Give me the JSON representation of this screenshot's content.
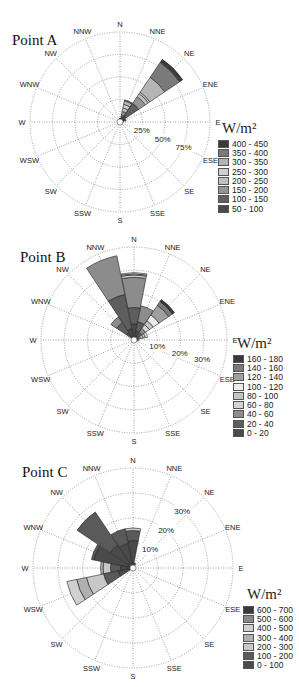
{
  "directions": [
    "N",
    "NNE",
    "NE",
    "ENE",
    "E",
    "ESE",
    "SE",
    "SSE",
    "S",
    "SSW",
    "SW",
    "WSW",
    "W",
    "WNW",
    "NW",
    "NNW"
  ],
  "chart_data": [
    {
      "type": "wind-rose",
      "title": "Point A",
      "unit": "W/m²",
      "rings": [
        25,
        50,
        75,
        100
      ],
      "ring_labels": [
        "25%",
        "50%",
        "75%"
      ],
      "legend": [
        "400 - 450",
        "350 - 400",
        "300 - 350",
        "250 - 300",
        "200 - 250",
        "150 - 200",
        "100 - 150",
        "50 - 100"
      ],
      "colors": [
        "#3a3a3a",
        "#7a7a7a",
        "#b5b5b5",
        "#cfcfcf",
        "#c0c0c0",
        "#959595",
        "#606060",
        "#4a4a4a"
      ],
      "bins_bottom_up": [
        "50 - 100",
        "100 - 150",
        "150 - 200",
        "200 - 250",
        "250 - 300",
        "300 - 350",
        "350 - 400",
        "400 - 450"
      ],
      "series": [
        {
          "dir": "N",
          "cum": [
            2,
            3,
            3.5,
            4,
            4,
            4,
            4,
            4
          ]
        },
        {
          "dir": "NNE",
          "cum": [
            5,
            8,
            12,
            16,
            20,
            24,
            25,
            25
          ]
        },
        {
          "dir": "NE",
          "cum": [
            8,
            25,
            34,
            38,
            40,
            60,
            80,
            84
          ]
        },
        {
          "dir": "ENE",
          "cum": [
            4,
            6,
            7,
            7,
            7,
            7,
            7,
            7
          ]
        },
        {
          "dir": "E",
          "cum": [
            1,
            1.5,
            1.5,
            1.5,
            1.5,
            1.5,
            1.5,
            1.5
          ]
        }
      ]
    },
    {
      "type": "wind-rose",
      "title": "Point B",
      "unit": "W/m²",
      "rings": [
        10,
        20,
        30,
        40
      ],
      "ring_labels": [
        "10%",
        "20%",
        "30%"
      ],
      "legend": [
        "160 - 180",
        "140 - 160",
        "120 - 140",
        "100 - 120",
        "80 - 100",
        "60 - 80",
        "40 - 60",
        "20 - 40",
        "0 - 20"
      ],
      "colors": [
        "#3a3a3a",
        "#7a7a7a",
        "#a0a0a0",
        "#ececec",
        "#c4c4c4",
        "#d4d4d4",
        "#8c8c8c",
        "#5e5e5e",
        "#4a4a4a"
      ],
      "series": [
        {
          "dir": "N",
          "cum": [
            7,
            14,
            27,
            28,
            28.5,
            29,
            29,
            29,
            29
          ]
        },
        {
          "dir": "NNE",
          "cum": [
            4,
            8,
            15,
            15,
            15,
            15,
            15,
            15,
            15
          ]
        },
        {
          "dir": "NE",
          "cum": [
            2,
            4,
            6,
            8,
            10,
            13,
            18,
            20,
            21
          ]
        },
        {
          "dir": "ENE",
          "cum": [
            1,
            2,
            3,
            4,
            5,
            6,
            6,
            6,
            6
          ]
        },
        {
          "dir": "E",
          "cum": [
            0.5,
            1,
            1.5,
            2,
            2,
            2,
            2,
            2,
            2
          ]
        },
        {
          "dir": "NW",
          "cum": [
            4,
            9,
            12,
            12,
            12,
            12,
            12,
            12,
            12
          ]
        },
        {
          "dir": "NNW",
          "cum": [
            5,
            20,
            37,
            37,
            37,
            37,
            37,
            37,
            37
          ]
        }
      ]
    },
    {
      "type": "wind-rose",
      "title": "Point C",
      "unit": "W/m²",
      "rings": [
        10,
        20,
        30,
        40
      ],
      "ring_labels": [
        "10%",
        "20%",
        "30%"
      ],
      "legend": [
        "600 - 700",
        "500 - 600",
        "400 - 500",
        "300 - 400",
        "200 - 300",
        "100 - 200",
        "0 - 100"
      ],
      "colors": [
        "#3a3a3a",
        "#8a8a8a",
        "#d0d0d0",
        "#b0b0b0",
        "#c8c8c8",
        "#5a5a5a",
        "#4a4a4a"
      ],
      "series": [
        {
          "dir": "N",
          "cum": [
            11,
            15,
            16,
            16,
            16,
            16,
            16
          ]
        },
        {
          "dir": "NNE",
          "cum": [
            2,
            2,
            2,
            2,
            2,
            2,
            2
          ]
        },
        {
          "dir": "NNW",
          "cum": [
            10,
            16,
            16,
            16,
            16,
            16,
            16
          ]
        },
        {
          "dir": "NW",
          "cum": [
            11,
            27,
            27,
            27,
            27,
            27,
            27
          ]
        },
        {
          "dir": "WNW",
          "cum": [
            16,
            17,
            17,
            17,
            17,
            17,
            17
          ]
        },
        {
          "dir": "W",
          "cum": [
            5,
            9,
            12,
            13,
            13,
            13,
            13
          ]
        },
        {
          "dir": "WSW",
          "cum": [
            6,
            12,
            19,
            23,
            27,
            27,
            27
          ]
        }
      ]
    }
  ]
}
